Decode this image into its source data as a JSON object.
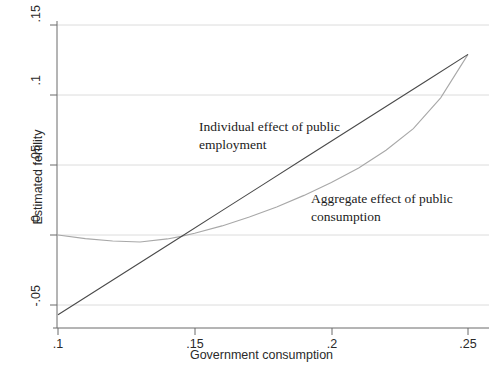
{
  "chart_data": {
    "type": "line",
    "title": "",
    "xlabel": "Government consumption",
    "ylabel": "Estimated fertility",
    "xlim": [
      0.1,
      0.25
    ],
    "ylim": [
      -0.057,
      0.15
    ],
    "grid": true,
    "grid_axis": "y",
    "legend_position": "inline-annotations",
    "xticks": [
      "0.1",
      "0.15",
      "0.2",
      "0.25"
    ],
    "xtick_labels": [
      ".1",
      ".15",
      ".2",
      ".25"
    ],
    "yticks": [
      "-0.05",
      "0",
      "0.05",
      "0.1",
      "0.15"
    ],
    "ytick_labels": [
      "-.05",
      "0",
      ".05",
      ".1",
      ".15"
    ],
    "series": [
      {
        "name": "Individual effect of public employment",
        "style": "straight-line",
        "color": "#4a4a4a",
        "x": [
          0.1,
          0.115,
          0.13,
          0.145,
          0.16,
          0.175,
          0.19,
          0.205,
          0.22,
          0.235,
          0.25
        ],
        "values": [
          -0.057,
          -0.0384,
          -0.0198,
          -0.0012,
          0.0174,
          0.036,
          0.0546,
          0.0732,
          0.0918,
          0.1104,
          0.129
        ]
      },
      {
        "name": "Aggregate effect of public consumption",
        "style": "curved-line",
        "color": "#a8a8a8",
        "x": [
          0.1,
          0.11,
          0.12,
          0.13,
          0.14,
          0.145,
          0.15,
          0.16,
          0.17,
          0.18,
          0.19,
          0.2,
          0.21,
          0.22,
          0.23,
          0.24,
          0.25
        ],
        "values": [
          0.0,
          -0.0026,
          -0.0043,
          -0.005,
          -0.0028,
          -0.001,
          0.0012,
          0.0065,
          0.0128,
          0.02,
          0.0283,
          0.0375,
          0.0478,
          0.0605,
          0.076,
          0.098,
          0.129
        ]
      }
    ],
    "annotations": [
      {
        "id": "individual",
        "text": "Individual effect of public\nemployment",
        "x": 0.2,
        "y": 0.08
      },
      {
        "id": "aggregate",
        "text": "Aggregate effect of public\nconsumption",
        "x": 0.23,
        "y": 0.03
      }
    ]
  },
  "axes": {
    "y_title": "Estimated fertility",
    "x_title": "Government consumption",
    "y_tick_labels": [
      ".15",
      ".1",
      ".05",
      "0",
      "-.05"
    ],
    "x_tick_labels": [
      ".1",
      ".15",
      ".2",
      ".25"
    ]
  },
  "colors": {
    "individual_line": "#4a4a4a",
    "aggregate_line": "#a8a8a8",
    "gridline": "#d9d9d9",
    "axis": "#555555",
    "text": "#2a2a2a",
    "background": "#ffffff"
  }
}
